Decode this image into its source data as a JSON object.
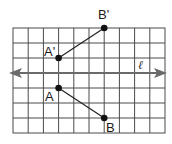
{
  "diagram": {
    "type": "reflection-over-line",
    "grid": {
      "columns": 10,
      "rows": 7,
      "cell_size_px": 15.2,
      "line_color": "#555555"
    },
    "line": {
      "label": "ℓ",
      "color": "#666666"
    },
    "points": [
      {
        "name": "A",
        "label": "A",
        "col": 3,
        "row": 4
      },
      {
        "name": "B",
        "label": "B",
        "col": 6,
        "row": 6
      },
      {
        "name": "A'",
        "label": "A'",
        "col": 3,
        "row": 2
      },
      {
        "name": "B'",
        "label": "B'",
        "col": 6,
        "row": 0
      }
    ],
    "segments": [
      {
        "from": "A",
        "to": "B"
      },
      {
        "from": "A'",
        "to": "B'"
      }
    ]
  }
}
